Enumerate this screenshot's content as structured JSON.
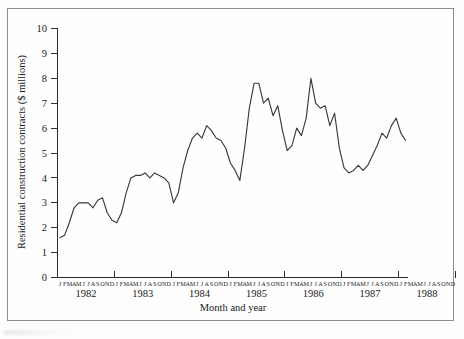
{
  "figure": {
    "background_color": "#fdfdfc",
    "frame_color": "#8d8d8d",
    "line_color": "#3a3a3a"
  },
  "axis_titles": {
    "y": "Residential construction contracts ($ millions)",
    "x": "Month and year"
  },
  "y_ticks": [
    "0",
    "1",
    "2",
    "3",
    "4",
    "5",
    "6",
    "7",
    "8",
    "9",
    "10"
  ],
  "month_letters": "JFMAMJJASOND",
  "years": [
    "1982",
    "1983",
    "1984",
    "1985",
    "1986",
    "1987",
    "1988"
  ],
  "chart_data": {
    "type": "line",
    "title": "",
    "xlabel": "Month and year",
    "ylabel": "Residential construction contracts ($ millions)",
    "ylim": [
      0,
      10
    ],
    "ytick_values": [
      0,
      1,
      2,
      3,
      4,
      5,
      6,
      7,
      8,
      9,
      10
    ],
    "grid": false,
    "legend": "none",
    "x_group_labels": [
      "1982",
      "1983",
      "1984",
      "1985",
      "1986",
      "1987",
      "1988"
    ],
    "x_tick_letters": [
      "J",
      "F",
      "M",
      "A",
      "M",
      "J",
      "J",
      "A",
      "S",
      "O",
      "N",
      "D"
    ],
    "series": [
      {
        "name": "Residential construction contracts",
        "units": "$ millions",
        "x": [
          "1982-01",
          "1982-02",
          "1982-03",
          "1982-04",
          "1982-05",
          "1982-06",
          "1982-07",
          "1982-08",
          "1982-09",
          "1982-10",
          "1982-11",
          "1982-12",
          "1983-01",
          "1983-02",
          "1983-03",
          "1983-04",
          "1983-05",
          "1983-06",
          "1983-07",
          "1983-08",
          "1983-09",
          "1983-10",
          "1983-11",
          "1983-12",
          "1984-01",
          "1984-02",
          "1984-03",
          "1984-04",
          "1984-05",
          "1984-06",
          "1984-07",
          "1984-08",
          "1984-09",
          "1984-10",
          "1984-11",
          "1984-12",
          "1985-01",
          "1985-02",
          "1985-03",
          "1985-04",
          "1985-05",
          "1985-06",
          "1985-07",
          "1985-08",
          "1985-09",
          "1985-10",
          "1985-11",
          "1985-12",
          "1986-01",
          "1986-02",
          "1986-03",
          "1986-04",
          "1986-05",
          "1986-06",
          "1986-07",
          "1986-08",
          "1986-09",
          "1986-10",
          "1986-11",
          "1986-12",
          "1987-01",
          "1987-02",
          "1987-03",
          "1987-04",
          "1987-05",
          "1987-06",
          "1987-07",
          "1987-08",
          "1987-09",
          "1987-10",
          "1987-11",
          "1987-12",
          "1988-01",
          "1988-02"
        ],
        "values": [
          1.6,
          1.7,
          2.2,
          2.8,
          3.0,
          3.0,
          3.0,
          2.8,
          3.1,
          3.2,
          2.6,
          2.3,
          2.2,
          2.6,
          3.4,
          4.0,
          4.1,
          4.1,
          4.2,
          4.0,
          4.2,
          4.1,
          4.0,
          3.8,
          3.0,
          3.4,
          4.4,
          5.1,
          5.6,
          5.8,
          5.6,
          6.1,
          5.9,
          5.6,
          5.5,
          5.2,
          4.6,
          4.3,
          3.9,
          5.2,
          6.8,
          7.8,
          7.8,
          7.0,
          7.2,
          6.5,
          6.9,
          5.9,
          5.1,
          5.3,
          6.0,
          5.7,
          6.4,
          8.0,
          7.0,
          6.8,
          6.9,
          6.1,
          6.6,
          5.2,
          4.4,
          4.2,
          4.3,
          4.5,
          4.3,
          4.5,
          4.9,
          5.3,
          5.8,
          5.6,
          6.1,
          6.4,
          5.8,
          5.5
        ]
      }
    ]
  }
}
